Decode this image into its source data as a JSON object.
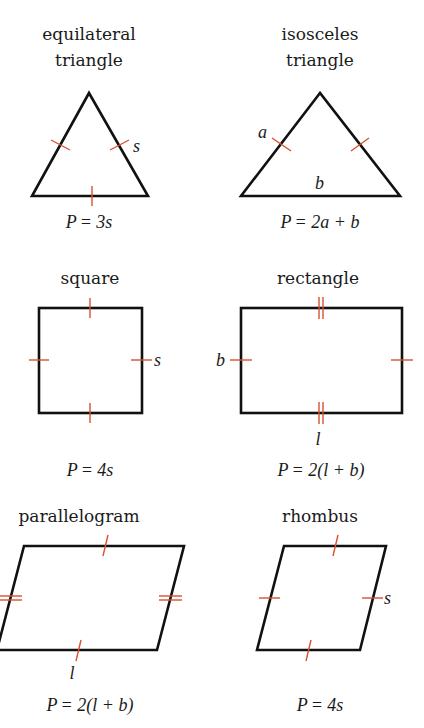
{
  "colors": {
    "outline": "#111111",
    "tick_marks": "#d9502e",
    "text": "#1a1a1a",
    "background": "#ffffff"
  },
  "shapes": [
    {
      "id": "equilateral-triangle",
      "title_line1": "equilateral",
      "title_line2": "triangle",
      "side_labels": [
        "s"
      ],
      "formula_lhs": "P",
      "formula_rhs": "= 3s"
    },
    {
      "id": "isosceles-triangle",
      "title_line1": "isosceles",
      "title_line2": "triangle",
      "side_labels": [
        "a",
        "b"
      ],
      "formula_lhs": "P",
      "formula_rhs": "= 2a + b"
    },
    {
      "id": "square",
      "title_line1": "square",
      "side_labels": [
        "s"
      ],
      "formula_lhs": "P",
      "formula_rhs": "= 4s"
    },
    {
      "id": "rectangle",
      "title_line1": "rectangle",
      "side_labels": [
        "b",
        "l"
      ],
      "formula_lhs": "P",
      "formula_rhs": "= 2(l + b)"
    },
    {
      "id": "parallelogram",
      "title_line1": "parallelogram",
      "side_labels": [
        "l"
      ],
      "formula_lhs": "P",
      "formula_rhs": "= 2(l + b)"
    },
    {
      "id": "rhombus",
      "title_line1": "rhombus",
      "side_labels": [
        "s"
      ],
      "formula_lhs": "P",
      "formula_rhs": "= 4s"
    }
  ]
}
